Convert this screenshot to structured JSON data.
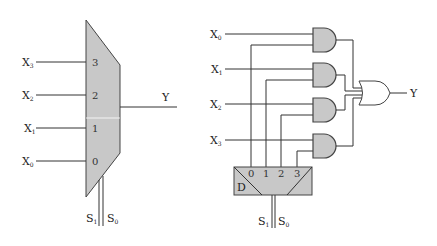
{
  "left_diagram": {
    "name": "4-to-1 multiplexer block",
    "inputs": [
      {
        "label": "X",
        "sub": "3",
        "port": "3"
      },
      {
        "label": "X",
        "sub": "2",
        "port": "2"
      },
      {
        "label": "X",
        "sub": "1",
        "port": "1"
      },
      {
        "label": "X",
        "sub": "0",
        "port": "0"
      }
    ],
    "output": "Y",
    "selects": [
      {
        "label": "S",
        "sub": "1"
      },
      {
        "label": "S",
        "sub": "0"
      }
    ]
  },
  "right_diagram": {
    "name": "Multiplexer gate-level implementation",
    "inputs": [
      {
        "label": "X",
        "sub": "0"
      },
      {
        "label": "X",
        "sub": "1"
      },
      {
        "label": "X",
        "sub": "2"
      },
      {
        "label": "X",
        "sub": "3"
      }
    ],
    "decoder": {
      "label": "D",
      "outputs": [
        "0",
        "1",
        "2",
        "3"
      ]
    },
    "output": "Y",
    "selects": [
      {
        "label": "S",
        "sub": "1"
      },
      {
        "label": "S",
        "sub": "0"
      }
    ],
    "colors": {
      "fill": "#c8c8c8",
      "stroke": "#444444"
    }
  }
}
